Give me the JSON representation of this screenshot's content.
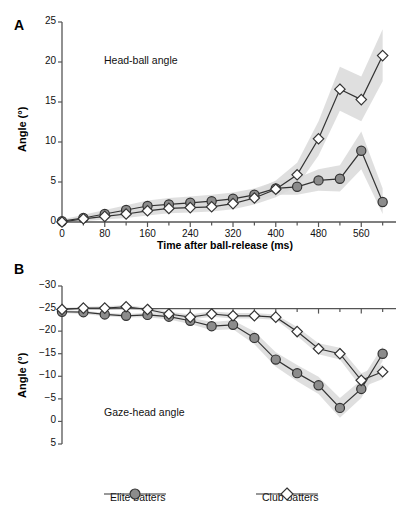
{
  "figure": {
    "panels": [
      {
        "id": "A",
        "letter": "A",
        "title": "Head-ball angle",
        "ylabel": "Angle (°)",
        "xlabel": "Time after ball-release (ms)",
        "yticks": [
          "25",
          "20",
          "15",
          "10",
          "5",
          "0"
        ],
        "xticks": [
          "0",
          "80",
          "160",
          "240",
          "320",
          "400",
          "480",
          "560"
        ]
      },
      {
        "id": "B",
        "letter": "B",
        "title": "Gaze-head angle",
        "ylabel": "Angle (°)",
        "xlabel": "",
        "yticks": [
          "5",
          "0",
          "−5",
          "−10",
          "−15",
          "−20",
          "−25",
          "−30"
        ],
        "xticks": []
      }
    ]
  },
  "legend": {
    "position": "bottom",
    "items": [
      {
        "label": "Elite batters",
        "marker": "filled-circle",
        "color": "#8c8c8c"
      },
      {
        "label": "Club batters",
        "marker": "open-diamond",
        "color": "#ffffff"
      }
    ]
  },
  "colors": {
    "marker_fill_elite": "#8c8c8c",
    "marker_fill_club": "#ffffff",
    "marker_stroke": "#333333",
    "line": "#333333",
    "band": "#d9d9d9",
    "axis": "#555555"
  },
  "chart_data": [
    {
      "type": "line",
      "panel": "A",
      "title": "Head-ball angle",
      "xlabel": "Time after ball-release (ms)",
      "ylabel": "Angle (°)",
      "xlim": [
        0,
        610
      ],
      "ylim": [
        0,
        25
      ],
      "ytick_values": [
        0,
        5,
        10,
        15,
        20,
        25
      ],
      "xtick_values": [
        0,
        80,
        160,
        240,
        320,
        400,
        480,
        560
      ],
      "xtick_minor_step": 40,
      "grid": false,
      "x": [
        0,
        40,
        80,
        120,
        160,
        200,
        240,
        280,
        320,
        360,
        400,
        440,
        480,
        520,
        560,
        600
      ],
      "series": [
        {
          "name": "Elite batters",
          "marker": "filled-circle",
          "values": [
            0.1,
            0.5,
            1.0,
            1.5,
            2.0,
            2.2,
            2.4,
            2.6,
            2.9,
            3.4,
            4.2,
            4.4,
            5.2,
            5.4,
            8.9,
            2.5
          ],
          "band_lower": [
            0.0,
            0.2,
            0.6,
            1.0,
            1.4,
            1.6,
            1.8,
            2.0,
            2.3,
            2.7,
            3.4,
            3.4,
            3.9,
            3.8,
            6.6,
            1.0
          ],
          "band_upper": [
            0.3,
            0.9,
            1.5,
            2.1,
            2.7,
            3.0,
            3.2,
            3.4,
            3.7,
            4.2,
            5.1,
            5.5,
            6.6,
            7.1,
            11.3,
            4.2
          ]
        },
        {
          "name": "Club batters",
          "marker": "open-diamond",
          "values": [
            0.0,
            0.4,
            0.7,
            1.0,
            1.4,
            1.7,
            1.8,
            1.9,
            2.3,
            3.0,
            4.1,
            5.9,
            10.4,
            16.6,
            15.3,
            20.8
          ],
          "band_lower": [
            0.0,
            0.1,
            0.3,
            0.5,
            0.8,
            1.1,
            1.2,
            1.3,
            1.6,
            2.2,
            3.1,
            4.5,
            8.3,
            13.9,
            12.6,
            17.6
          ],
          "band_upper": [
            0.1,
            0.8,
            1.2,
            1.6,
            2.1,
            2.4,
            2.5,
            2.6,
            3.1,
            3.9,
            5.2,
            7.4,
            12.6,
            19.4,
            18.2,
            24.1
          ]
        }
      ]
    },
    {
      "type": "line",
      "panel": "B",
      "title": "Gaze-head angle",
      "xlabel": "",
      "ylabel": "Angle (°)",
      "xlim": [
        0,
        610
      ],
      "ylim": [
        -30,
        5
      ],
      "ytick_values": [
        5,
        0,
        -5,
        -10,
        -15,
        -20,
        -25,
        -30
      ],
      "xtick_values": [
        0,
        80,
        160,
        240,
        320,
        400,
        480,
        560
      ],
      "xtick_minor_step": 40,
      "grid": false,
      "x": [
        0,
        40,
        80,
        120,
        160,
        200,
        240,
        280,
        320,
        360,
        400,
        440,
        480,
        520,
        560,
        600
      ],
      "series": [
        {
          "name": "Elite batters",
          "marker": "filled-circle",
          "values": [
            -0.7,
            -0.8,
            -1.3,
            -1.6,
            -1.4,
            -1.8,
            -2.7,
            -3.9,
            -3.6,
            -6.5,
            -11.3,
            -14.3,
            -17.0,
            -22.0,
            -17.8,
            -10.0
          ],
          "band_lower": [
            -1.0,
            -1.2,
            -1.7,
            -2.0,
            -1.9,
            -2.4,
            -3.4,
            -4.8,
            -4.6,
            -7.9,
            -12.9,
            -16.1,
            -18.9,
            -24.2,
            -19.8,
            -11.6
          ],
          "band_upper": [
            -0.4,
            -0.5,
            -0.9,
            -1.2,
            -0.9,
            -1.2,
            -2.0,
            -3.0,
            -2.6,
            -5.1,
            -9.7,
            -12.5,
            -15.1,
            -19.8,
            -15.8,
            -8.4
          ]
        },
        {
          "name": "Club batters",
          "marker": "open-diamond",
          "values": [
            -0.2,
            0.1,
            0.1,
            0.4,
            -0.2,
            -1.2,
            -1.9,
            -1.2,
            -1.6,
            -1.6,
            -1.9,
            -5.1,
            -8.9,
            -10.0,
            -15.9,
            -14.0
          ],
          "band_lower": [
            -0.5,
            -0.2,
            -0.3,
            0.0,
            -0.6,
            -1.7,
            -2.5,
            -1.8,
            -2.2,
            -2.2,
            -2.5,
            -6.1,
            -10.1,
            -11.3,
            -17.5,
            -15.6
          ],
          "band_upper": [
            0.1,
            0.4,
            0.5,
            0.8,
            0.2,
            -0.7,
            -1.3,
            -0.6,
            -1.0,
            -1.0,
            -1.3,
            -4.1,
            -7.7,
            -8.7,
            -14.3,
            -12.4
          ]
        }
      ]
    }
  ]
}
